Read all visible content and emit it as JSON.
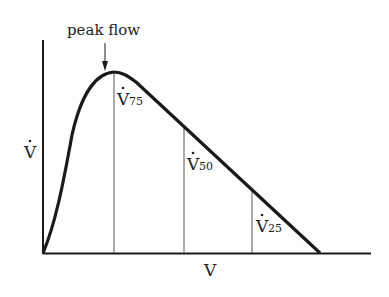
{
  "diagram": {
    "type": "flow-volume curve",
    "annotation": {
      "text": "peak flow"
    },
    "axes": {
      "y_label": {
        "main": "V",
        "dot": "˙"
      },
      "x_label": "V"
    },
    "markers": [
      {
        "main": "V",
        "sub": "75"
      },
      {
        "main": "V",
        "sub": "50"
      },
      {
        "main": "V",
        "sub": "25"
      }
    ],
    "colors": {
      "line": "#1a1a1a",
      "thin": "#555555",
      "text": "#222222"
    }
  }
}
